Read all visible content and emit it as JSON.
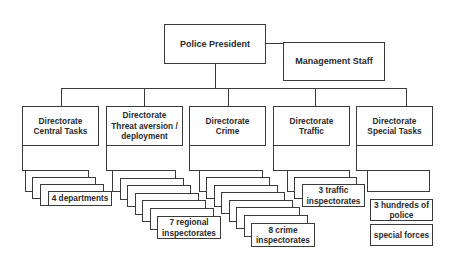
{
  "diagram": {
    "type": "org-chart",
    "top": {
      "label": "Police President"
    },
    "staff": {
      "label": "Management Staff"
    },
    "directorates": [
      {
        "label": "Directorate\nCentral Tasks",
        "units_label": "4 departments",
        "stack_count": 4
      },
      {
        "label": "Directorate\nThreat aversion /\ndeployment",
        "units_label": "7 regional\ninspectorates",
        "stack_count": 7
      },
      {
        "label": "Directorate\nCrime",
        "units_label": "8 crime\ninspectorates",
        "stack_count": 8
      },
      {
        "label": "Directorate\nTraffic",
        "units_label": "3 traffic\ninspectorates",
        "stack_count": 3
      },
      {
        "label": "Directorate\nSpecial Tasks",
        "units": [
          {
            "label": ""
          },
          {
            "label": "3 hundreds of\npolice"
          },
          {
            "label": "special forces"
          }
        ]
      }
    ]
  }
}
